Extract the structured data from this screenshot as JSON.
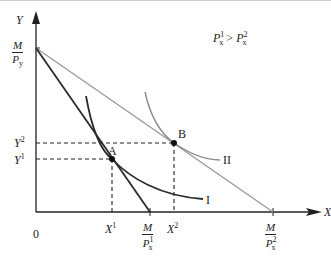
{
  "diagram": {
    "type": "indifference-curve-budget-line",
    "condition": {
      "lhs_base": "P",
      "lhs_sup": "1",
      "lhs_sub": "x",
      "op": ">",
      "rhs_base": "P",
      "rhs_sup": "2",
      "rhs_sub": "x"
    },
    "axes": {
      "x_label": "X",
      "y_label": "Y",
      "origin_label": "0"
    },
    "y_ticks": {
      "intercept": {
        "num": "M",
        "den_base": "P",
        "den_sub": "y"
      },
      "y2": {
        "base": "Y",
        "sup": "2"
      },
      "y1": {
        "base": "Y",
        "sup": "1"
      }
    },
    "x_ticks": {
      "x1": {
        "base": "X",
        "sup": "1"
      },
      "m_px1": {
        "num": "M",
        "den_base": "P",
        "den_sub": "x",
        "den_sup": "1"
      },
      "x2": {
        "base": "X",
        "sup": "2"
      },
      "m_px2": {
        "num": "M",
        "den_base": "P",
        "den_sub": "x",
        "den_sup": "2"
      }
    },
    "points": [
      {
        "label": "A",
        "x_ref": "X1",
        "y_ref": "Y1"
      },
      {
        "label": "B",
        "x_ref": "X2",
        "y_ref": "Y2"
      }
    ],
    "curves": [
      {
        "label": "I",
        "color": "#2b2b2b"
      },
      {
        "label": "II",
        "color": "#8c8c8c"
      }
    ],
    "budget_lines": [
      {
        "name": "budget-line-1",
        "from": "M/Py",
        "to": "M/Px1",
        "color": "#2b2b2b"
      },
      {
        "name": "budget-line-2",
        "from": "M/Py",
        "to": "M/Px2",
        "color": "#9a9a9a"
      }
    ]
  }
}
